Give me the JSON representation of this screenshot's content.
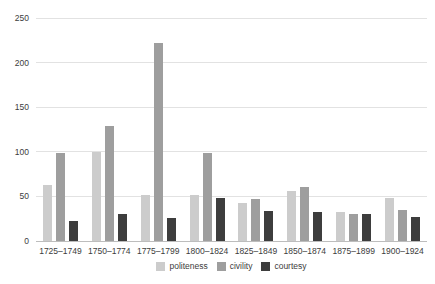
{
  "chart_data": {
    "type": "bar",
    "title": "",
    "xlabel": "",
    "ylabel": "",
    "categories": [
      "1725–1749",
      "1750–1774",
      "1775–1799",
      "1800–1824",
      "1825–1849",
      "1850–1874",
      "1875–1899",
      "1900–1924"
    ],
    "series": [
      {
        "name": "politeness",
        "color": "#cccccc",
        "values": [
          63,
          100,
          52,
          52,
          43,
          56,
          33,
          48
        ]
      },
      {
        "name": "civility",
        "color": "#9e9e9e",
        "values": [
          99,
          129,
          222,
          99,
          47,
          60,
          30,
          35
        ]
      },
      {
        "name": "courtesy",
        "color": "#3d3d3d",
        "values": [
          22,
          30,
          26,
          48,
          34,
          32,
          30,
          27
        ]
      }
    ],
    "ylim": [
      0,
      250
    ],
    "y_ticks": [
      0,
      50,
      100,
      150,
      200,
      250
    ],
    "grid": true,
    "legend_position": "bottom"
  },
  "colors": {
    "background": "#ffffff",
    "gridline": "#e2e2e2",
    "axis_line": "#bdbdbd",
    "text": "#3c3c3c"
  }
}
